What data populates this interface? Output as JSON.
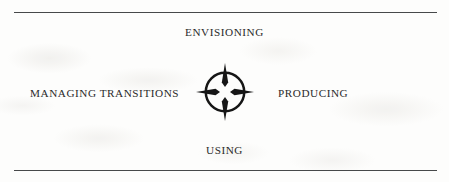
{
  "figure": {
    "name": "four-phase-cycle-diagram",
    "background_color": "#fdfdfc",
    "ink_color": "#2a2a2a",
    "rule_color": "#47494a",
    "rules": {
      "top_label": "top horizontal rule",
      "bottom_label": "bottom horizontal rule"
    },
    "center_icon": {
      "name": "compass-rose-icon",
      "description": "open circle with four triangular points at top, right, bottom and left"
    },
    "labels": {
      "top": "ENVISIONING",
      "right": "PRODUCING",
      "bottom": "USING",
      "left": "MANAGING TRANSITIONS"
    }
  }
}
